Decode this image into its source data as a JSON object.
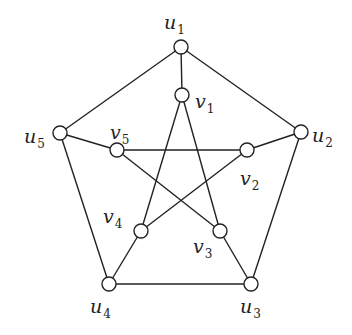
{
  "diagram": {
    "nodes": [
      {
        "id": "u1",
        "base": "u",
        "sub": "1",
        "x": 181,
        "y": 47,
        "lx": 164,
        "ly": 29
      },
      {
        "id": "u2",
        "base": "u",
        "sub": "2",
        "x": 301,
        "y": 132,
        "lx": 312,
        "ly": 142
      },
      {
        "id": "u3",
        "base": "u",
        "sub": "3",
        "x": 251,
        "y": 284,
        "lx": 240,
        "ly": 313
      },
      {
        "id": "u4",
        "base": "u",
        "sub": "4",
        "x": 109,
        "y": 284,
        "lx": 90,
        "ly": 313
      },
      {
        "id": "u5",
        "base": "u",
        "sub": "5",
        "x": 60,
        "y": 133,
        "lx": 24,
        "ly": 143
      },
      {
        "id": "v1",
        "base": "v",
        "sub": "1",
        "x": 182,
        "y": 95,
        "lx": 195,
        "ly": 108
      },
      {
        "id": "v2",
        "base": "v",
        "sub": "2",
        "x": 247,
        "y": 150,
        "lx": 240,
        "ly": 185
      },
      {
        "id": "v3",
        "base": "v",
        "sub": "3",
        "x": 220,
        "y": 231,
        "lx": 193,
        "ly": 253
      },
      {
        "id": "v4",
        "base": "v",
        "sub": "4",
        "x": 141,
        "y": 231,
        "lx": 103,
        "ly": 223
      },
      {
        "id": "v5",
        "base": "v",
        "sub": "5",
        "x": 117,
        "y": 150,
        "lx": 110,
        "ly": 139
      }
    ],
    "edges": [
      [
        "u1",
        "u2"
      ],
      [
        "u2",
        "u3"
      ],
      [
        "u3",
        "u4"
      ],
      [
        "u4",
        "u5"
      ],
      [
        "u5",
        "u1"
      ],
      [
        "u1",
        "v1"
      ],
      [
        "u2",
        "v2"
      ],
      [
        "u3",
        "v3"
      ],
      [
        "u4",
        "v4"
      ],
      [
        "u5",
        "v5"
      ],
      [
        "v1",
        "v3"
      ],
      [
        "v1",
        "v4"
      ],
      [
        "v5",
        "v2"
      ],
      [
        "v5",
        "v3"
      ],
      [
        "v2",
        "v4"
      ]
    ],
    "colors": {
      "stroke": "#222222",
      "node_fill": "#ffffff",
      "background": "#ffffff"
    },
    "node_radius": 7
  }
}
